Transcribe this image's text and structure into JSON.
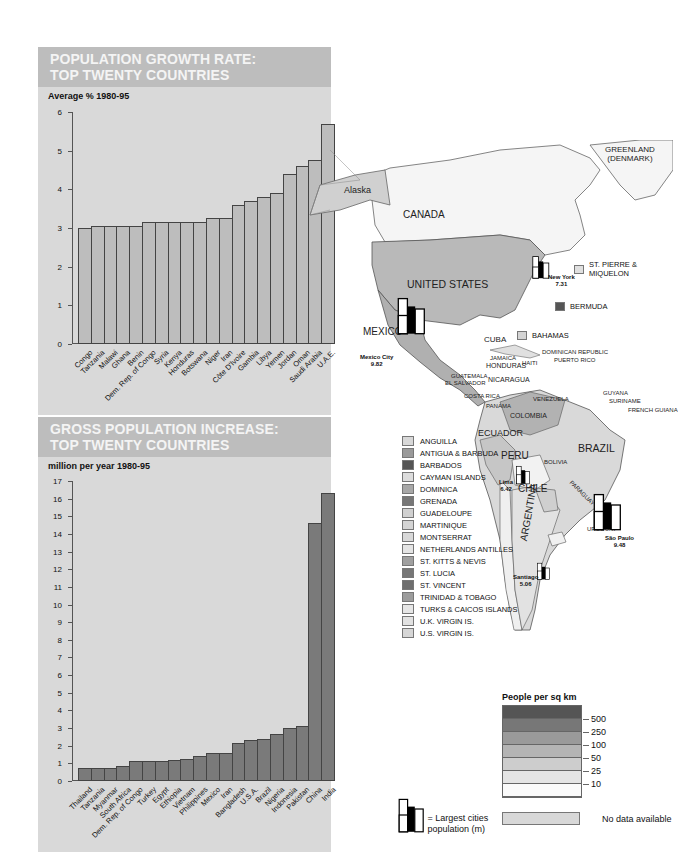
{
  "header_fragment": "",
  "chart_data": [
    {
      "type": "bar",
      "title": "POPULATION GROWTH RATE: TOP TWENTY COUNTRIES",
      "title_lines": [
        "POPULATION GROWTH RATE:",
        "TOP TWENTY COUNTRIES"
      ],
      "ylabel": "Average % 1980-95",
      "xlabel": "",
      "ylim": [
        0,
        6
      ],
      "yticks": [
        "0",
        "1",
        "2",
        "3",
        "4",
        "5",
        "6"
      ],
      "grid": false,
      "bar_color": "#bdbdbd",
      "categories": [
        "Congo",
        "Tanzania",
        "Malawi",
        "Ghana",
        "Benin",
        "Dem. Rep. of Congo",
        "Syria",
        "Kenya",
        "Honduras",
        "Botswana",
        "Niger",
        "Iran",
        "Côte D'Ivoire",
        "Gambia",
        "Libya",
        "Yemen",
        "Jordan",
        "Oman",
        "Saudi Arabia",
        "U.A.E."
      ],
      "values": [
        3.0,
        3.05,
        3.05,
        3.05,
        3.05,
        3.15,
        3.15,
        3.15,
        3.15,
        3.15,
        3.25,
        3.25,
        3.6,
        3.7,
        3.8,
        3.9,
        4.4,
        4.6,
        4.75,
        5.7
      ]
    },
    {
      "type": "bar",
      "title": "GROSS POPULATION INCREASE: TOP TWENTY COUNTRIES",
      "title_lines": [
        "GROSS POPULATION INCREASE:",
        "TOP TWENTY COUNTRIES"
      ],
      "ylabel": "million per year 1980-95",
      "xlabel": "",
      "ylim": [
        0,
        17
      ],
      "yticks": [
        "0",
        "1",
        "2",
        "3",
        "4",
        "5",
        "6",
        "7",
        "8",
        "9",
        "10",
        "11",
        "12",
        "13",
        "14",
        "15",
        "16",
        "17"
      ],
      "grid": false,
      "bar_color": "#7a7a7a",
      "categories": [
        "Thailand",
        "Tanzania",
        "Myanmar",
        "South Africa",
        "Dem. Rep. of Congo",
        "Turkey",
        "Egypt",
        "Ethiopia",
        "Vietnam",
        "Philippines",
        "Mexico",
        "Iran",
        "Bangladesh",
        "U.S.A.",
        "Brazil",
        "Nigeria",
        "Indonesia",
        "Pakistan",
        "China",
        "India"
      ],
      "values": [
        0.75,
        0.75,
        0.75,
        0.85,
        1.15,
        1.15,
        1.15,
        1.2,
        1.25,
        1.4,
        1.6,
        1.6,
        2.15,
        2.3,
        2.4,
        2.65,
        3.0,
        3.1,
        14.6,
        16.3
      ]
    }
  ],
  "map": {
    "labels": {
      "alaska": "Alaska",
      "canada": "CANADA",
      "greenland": "GREENLAND\n(DENMARK)",
      "greenland_1": "GREENLAND",
      "greenland_2": "(DENMARK)",
      "united_states": "UNITED STATES",
      "mexico": "MEXICO",
      "cuba": "CUBA",
      "jamaica": "JAMAICA",
      "haiti": "HAITI",
      "dominican_republic": "DOMINICAN REPUBLIC",
      "puerto_rico": "PUERTO RICO",
      "honduras": "HONDURAS",
      "guatemala": "GUATEMALA",
      "el_salvador": "EL SALVADOR",
      "nicaragua": "NICARAGUA",
      "costa_rica": "COSTA RICA",
      "panama": "PANAMA",
      "venezuela": "VENEZUELA",
      "colombia": "COLOMBIA",
      "guyana": "GUYANA",
      "suriname": "SURINAME",
      "french_guiana": "FRENCH GUIANA",
      "ecuador": "ECUADOR",
      "peru": "PERU",
      "brazil": "BRAZIL",
      "bolivia": "BOLIVIA",
      "paraguay": "PARAGUAY",
      "chile": "CHILE",
      "argentina": "ARGENTINA",
      "uruguay": "URUGUAY"
    },
    "swatches": {
      "st_pierre_1": "ST. PIERRE &",
      "st_pierre_2": "MIQUELON",
      "bermuda": "BERMUDA",
      "bahamas": "BAHAMAS"
    },
    "cities": [
      {
        "name": "New York",
        "pop": "7.31"
      },
      {
        "name": "Mexico City",
        "pop": "9.82"
      },
      {
        "name": "Lima",
        "pop": "6.42"
      },
      {
        "name": "São Paulo",
        "pop": "9.48"
      },
      {
        "name": "Santiago",
        "pop": "5.06"
      }
    ]
  },
  "island_legend": [
    {
      "label": "ANGUILLA",
      "color": "#d8d8d8"
    },
    {
      "label": "ANTIGUA & BARBUDA",
      "color": "#9a9a9a"
    },
    {
      "label": "BARBADOS",
      "color": "#555555"
    },
    {
      "label": "CAYMAN ISLANDS",
      "color": "#dcdcdc"
    },
    {
      "label": "DOMINICA",
      "color": "#a8a8a8"
    },
    {
      "label": "GRENADA",
      "color": "#777777"
    },
    {
      "label": "GUADELOUPE",
      "color": "#d0d0d0"
    },
    {
      "label": "MARTINIQUE",
      "color": "#d4d4d4"
    },
    {
      "label": "MONTSERRAT",
      "color": "#d8d8d8"
    },
    {
      "label": "NETHERLANDS ANTILLES",
      "color": "#e4e4e4"
    },
    {
      "label": "ST. KITTS & NEVIS",
      "color": "#a0a0a0"
    },
    {
      "label": "ST. LUCIA",
      "color": "#777777"
    },
    {
      "label": "ST. VINCENT",
      "color": "#6e6e6e"
    },
    {
      "label": "TRINIDAD & TOBAGO",
      "color": "#9c9c9c"
    },
    {
      "label": "TURKS & CAICOS ISLANDS",
      "color": "#e6e6e6"
    },
    {
      "label": "U.K. VIRGIN IS.",
      "color": "#e2e2e2"
    },
    {
      "label": "U.S. VIRGIN IS.",
      "color": "#d6d6d6"
    }
  ],
  "density_legend": {
    "title": "People per sq km",
    "bands": [
      "#555555",
      "#777777",
      "#9a9a9a",
      "#b4b4b4",
      "#cdcdcd",
      "#e4e4e4",
      "#fafafa"
    ],
    "thresholds": [
      "500",
      "250",
      "100",
      "50",
      "25",
      "10"
    ],
    "no_data_label": "No data available",
    "no_data_color": "#d8d8d8"
  },
  "city_key": {
    "line1": "= Largest cities",
    "line2": "population (m)"
  }
}
